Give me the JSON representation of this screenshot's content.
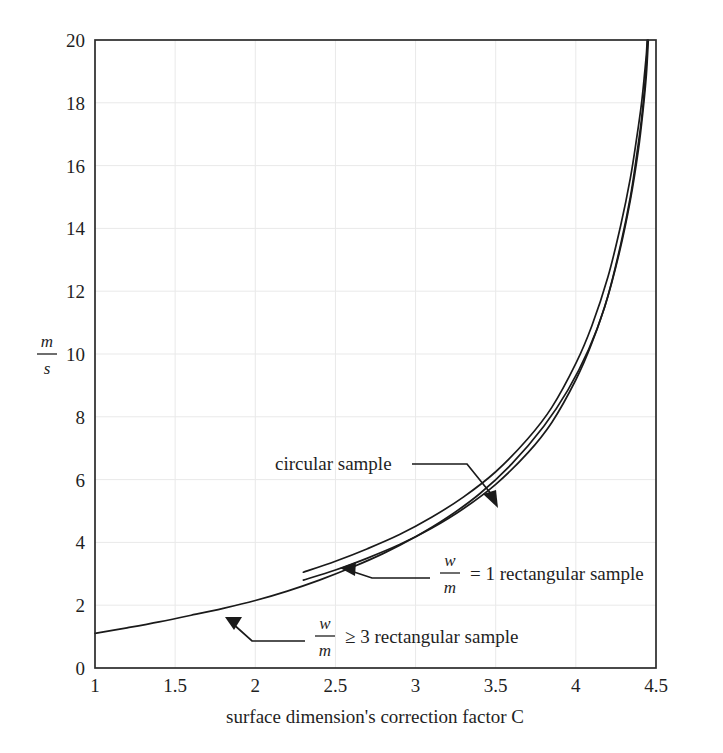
{
  "chart_data": {
    "type": "line",
    "title": "",
    "subtitle": "",
    "xlabel": "surface dimension's correction factor C",
    "ylabel": "m/s",
    "ylabel_numerator": "m",
    "ylabel_denominator": "s",
    "xlim": [
      1,
      4.5
    ],
    "ylim": [
      0,
      20
    ],
    "xticks": [
      1,
      1.5,
      2,
      2.5,
      3,
      3.5,
      4,
      4.5
    ],
    "xtick_labels": [
      "1",
      "1.5",
      "2",
      "2.5",
      "3",
      "3.5",
      "4",
      "4.5"
    ],
    "yticks": [
      0,
      2,
      4,
      6,
      8,
      10,
      12,
      14,
      16,
      18,
      20
    ],
    "ytick_labels": [
      "0",
      "2",
      "4",
      "6",
      "8",
      "10",
      "12",
      "14",
      "16",
      "18",
      "20"
    ],
    "grid": true,
    "grid_color": "#e9e9e9",
    "legend_position": "none",
    "asymptote_x": 4.45,
    "series": [
      {
        "name": "circular sample",
        "color": "#1a1a1a",
        "x": [
          2.3,
          2.5,
          2.7,
          2.9,
          3.1,
          3.3,
          3.5,
          3.7,
          3.85,
          4.0,
          4.1,
          4.2,
          4.28,
          4.34,
          4.38,
          4.41,
          4.43,
          4.44,
          4.445
        ],
        "y": [
          3.05,
          3.4,
          3.8,
          4.25,
          4.8,
          5.45,
          6.25,
          7.3,
          8.3,
          9.7,
          10.9,
          12.45,
          14.1,
          15.6,
          16.9,
          18.0,
          19.0,
          19.55,
          20.0
        ]
      },
      {
        "name": "w/m = 1 rectangular sample",
        "color": "#1a1a1a",
        "x": [
          2.3,
          2.5,
          2.7,
          2.9,
          3.1,
          3.3,
          3.5,
          3.7,
          3.85,
          4.0,
          4.1,
          4.2,
          4.28,
          4.34,
          4.38,
          4.41,
          4.43,
          4.44,
          4.448
        ],
        "y": [
          2.8,
          3.12,
          3.5,
          3.93,
          4.45,
          5.08,
          5.85,
          6.85,
          7.82,
          9.18,
          10.35,
          11.85,
          13.5,
          15.0,
          16.35,
          17.5,
          18.55,
          19.25,
          20.0
        ]
      },
      {
        "name": "w/m >= 3 rectangular sample",
        "color": "#1a1a1a",
        "x": [
          1.0,
          1.2,
          1.4,
          1.6,
          1.8,
          2.0,
          2.2,
          2.4,
          2.6,
          2.8,
          3.0,
          3.2,
          3.4,
          3.6,
          3.8,
          3.95,
          4.08,
          4.18,
          4.27,
          4.34,
          4.39,
          4.42,
          4.44,
          4.452
        ],
        "y": [
          1.1,
          1.28,
          1.47,
          1.68,
          1.9,
          2.15,
          2.45,
          2.8,
          3.2,
          3.65,
          4.18,
          4.8,
          5.55,
          6.5,
          7.7,
          8.85,
          10.15,
          11.5,
          13.2,
          14.9,
          16.5,
          17.8,
          18.9,
          20.0
        ]
      }
    ],
    "annotations": [
      {
        "name": "circular-sample",
        "text": "circular sample",
        "has_fraction": false,
        "text_x": 275,
        "text_y": 470
      },
      {
        "name": "rect-ratio-1",
        "text_before": "",
        "fraction_numerator": "w",
        "fraction_denominator": "m",
        "text_after": "= 1 rectangular sample",
        "has_fraction": true,
        "text_x": 440,
        "text_y": 573
      },
      {
        "name": "rect-ratio-3",
        "text_before": "",
        "fraction_numerator": "w",
        "fraction_denominator": "m",
        "text_after": "≥ 3 rectangular sample",
        "has_fraction": true,
        "text_x": 315,
        "text_y": 636
      }
    ]
  }
}
